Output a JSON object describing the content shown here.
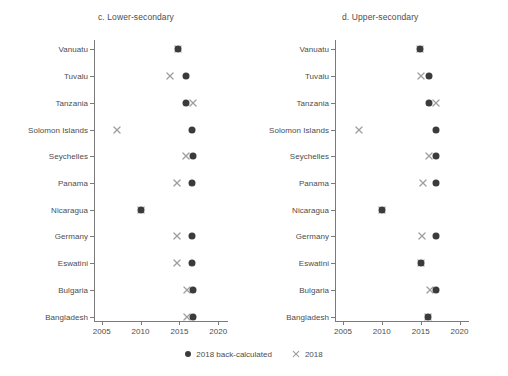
{
  "chart_data": {
    "type": "scatter",
    "title": "",
    "panels": [
      {
        "id": "c",
        "title": "c. Lower-secondary",
        "xlabel": "",
        "ylabel": "",
        "xlim": [
          2003.5,
          2021.5
        ],
        "xticks": [
          2005,
          2010,
          2015,
          2020
        ],
        "xticklabels": [
          "2005",
          "2010",
          "2015",
          "2020"
        ],
        "categories": [
          "Vanuatu",
          "Tuvalu",
          "Tanzania",
          "Solomon Islands",
          "Seychelles",
          "Panama",
          "Nicaragua",
          "Germany",
          "Eswatini",
          "Bulgaria",
          "Bangladesh"
        ],
        "series": [
          {
            "name": "2018 back-calculated",
            "marker": "dot",
            "color": "#3b3b3b",
            "values": [
              2014.8,
              2015.8,
              2015.9,
              2016.6,
              2016.7,
              2016.6,
              2010.0,
              2016.6,
              2016.6,
              2016.8,
              2016.8
            ]
          },
          {
            "name": "2018",
            "marker": "cross",
            "color": "#9e9e9e",
            "values": [
              2014.8,
              2013.8,
              2016.8,
              2007.0,
              2015.8,
              2014.7,
              2010.0,
              2014.7,
              2014.7,
              2016.0,
              2016.0
            ]
          }
        ]
      },
      {
        "id": "d",
        "title": "d. Upper-secondary",
        "xlabel": "",
        "ylabel": "",
        "xlim": [
          2003.5,
          2021.5
        ],
        "xticks": [
          2005,
          2010,
          2015,
          2020
        ],
        "xticklabels": [
          "2005",
          "2010",
          "2015",
          "2020"
        ],
        "categories": [
          "Vanuatu",
          "Tuvalu",
          "Tanzania",
          "Solomon Islands",
          "Seychelles",
          "Panama",
          "Nicaragua",
          "Germany",
          "Eswatini",
          "Bulgaria",
          "Bangladesh"
        ],
        "series": [
          {
            "name": "2018 back-calculated",
            "marker": "dot",
            "color": "#3b3b3b",
            "values": [
              2014.9,
              2016.1,
              2016.1,
              2017.0,
              2017.0,
              2017.0,
              2010.0,
              2017.0,
              2015.1,
              2017.0,
              2016.0
            ]
          },
          {
            "name": "2018",
            "marker": "cross",
            "color": "#9e9e9e",
            "values": [
              2014.9,
              2015.1,
              2017.0,
              2007.0,
              2016.1,
              2015.3,
              2010.0,
              2015.2,
              2015.1,
              2016.2,
              2016.0
            ]
          }
        ]
      }
    ],
    "legend": {
      "position": "bottom-center",
      "entries": [
        {
          "label": "2018 back-calculated",
          "marker": "dot",
          "color": "#3b3b3b"
        },
        {
          "label": "2018",
          "marker": "cross",
          "color": "#9e9e9e"
        }
      ]
    },
    "grid": false
  }
}
